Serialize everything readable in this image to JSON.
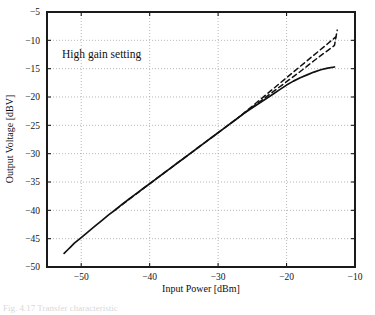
{
  "figure": {
    "caption_fragment": "Fig. 4.17  Transfer characteristic",
    "annotation": "High gain setting"
  },
  "chart_data": {
    "type": "line",
    "title": "",
    "xlabel": "Input Power [dBm]",
    "ylabel": "Output Voltage [dBV]",
    "xlim": [
      -55,
      -10
    ],
    "ylim": [
      -50,
      -5
    ],
    "xticks": [
      -50,
      -40,
      -30,
      -20,
      -10
    ],
    "xticklabels": [
      "−50",
      "−40",
      "−30",
      "−20",
      "−10"
    ],
    "yticks": [
      -50,
      -45,
      -40,
      -35,
      -30,
      -25,
      -20,
      -15,
      -10,
      -5
    ],
    "yticklabels": [
      "−50",
      "−45",
      "−40",
      "−35",
      "−30",
      "−25",
      "−20",
      "−15",
      "−10",
      "−5"
    ],
    "grid": true,
    "grid_style": "dotted",
    "legend": "none",
    "annotations": [
      {
        "text": "High gain setting",
        "x": -48.5,
        "y": -11.5
      }
    ],
    "series": [
      {
        "name": "measured",
        "style": "solid",
        "color": "#111111",
        "points": [
          [
            -52.5,
            -47.6
          ],
          [
            -52.0,
            -47.0
          ],
          [
            -51.5,
            -46.4
          ],
          [
            -51.0,
            -45.8
          ],
          [
            -50.0,
            -44.8
          ],
          [
            -49.0,
            -43.8
          ],
          [
            -48.0,
            -42.8
          ],
          [
            -47.0,
            -41.8
          ],
          [
            -46.0,
            -40.8
          ],
          [
            -45.0,
            -39.9
          ],
          [
            -44.0,
            -38.9
          ],
          [
            -43.0,
            -38.0
          ],
          [
            -42.0,
            -37.1
          ],
          [
            -41.0,
            -36.2
          ],
          [
            -40.0,
            -35.3
          ],
          [
            -39.0,
            -34.4
          ],
          [
            -38.0,
            -33.5
          ],
          [
            -37.0,
            -32.6
          ],
          [
            -36.0,
            -31.7
          ],
          [
            -35.0,
            -30.8
          ],
          [
            -34.0,
            -29.9
          ],
          [
            -33.0,
            -29.0
          ],
          [
            -32.0,
            -28.1
          ],
          [
            -31.0,
            -27.2
          ],
          [
            -30.0,
            -26.3
          ],
          [
            -29.0,
            -25.4
          ],
          [
            -28.0,
            -24.5
          ],
          [
            -27.0,
            -23.6
          ],
          [
            -26.0,
            -22.7
          ],
          [
            -25.0,
            -21.9
          ],
          [
            -24.0,
            -21.1
          ],
          [
            -23.0,
            -20.3
          ],
          [
            -22.0,
            -19.5
          ],
          [
            -21.0,
            -18.7
          ],
          [
            -20.0,
            -17.9
          ],
          [
            -19.0,
            -17.2
          ],
          [
            -18.0,
            -16.6
          ],
          [
            -17.0,
            -16.1
          ],
          [
            -16.0,
            -15.6
          ],
          [
            -15.0,
            -15.2
          ],
          [
            -14.0,
            -14.9
          ],
          [
            -13.0,
            -14.7
          ]
        ]
      },
      {
        "name": "ideal-linear",
        "style": "dashed",
        "color": "#111111",
        "points": [
          [
            -45.0,
            -39.9
          ],
          [
            -40.0,
            -35.3
          ],
          [
            -35.0,
            -30.8
          ],
          [
            -30.0,
            -26.3
          ],
          [
            -27.0,
            -23.6
          ],
          [
            -25.0,
            -21.8
          ],
          [
            -22.0,
            -19.1
          ],
          [
            -20.0,
            -17.3
          ],
          [
            -18.0,
            -15.5
          ],
          [
            -16.0,
            -13.6
          ],
          [
            -14.0,
            -11.8
          ],
          [
            -13.0,
            -10.9
          ],
          [
            -12.6,
            -8.2
          ]
        ]
      },
      {
        "name": "ideal-linear-upper",
        "style": "dashed",
        "color": "#111111",
        "points": [
          [
            -27.5,
            -24.1
          ],
          [
            -25.0,
            -21.6
          ],
          [
            -22.0,
            -18.6
          ],
          [
            -20.0,
            -16.6
          ],
          [
            -18.0,
            -14.6
          ],
          [
            -16.0,
            -12.6
          ],
          [
            -14.0,
            -10.6
          ],
          [
            -12.8,
            -9.4
          ]
        ]
      }
    ]
  }
}
